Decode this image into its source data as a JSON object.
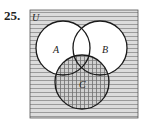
{
  "problem": {
    "number": "25.",
    "universe_label": "U",
    "sets": [
      {
        "label": "A",
        "cx": 63,
        "cy": 48,
        "r": 27
      },
      {
        "label": "B",
        "cx": 100,
        "cy": 48,
        "r": 27
      },
      {
        "label": "C",
        "cx": 82,
        "cy": 82,
        "r": 27
      }
    ],
    "shading": {
      "outside_circles": "horizontal-lines",
      "C": "crosshatch",
      "A_and_B_not_C": "white"
    },
    "colors": {
      "stroke": "#1a1a1a",
      "hatch": "#8a8a8a",
      "bg": "#d9d9d9"
    }
  }
}
